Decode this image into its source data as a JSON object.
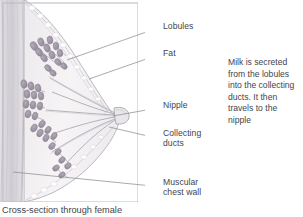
{
  "diagram": {
    "frame": {
      "x": 3,
      "y": 3,
      "width": 135,
      "height": 199
    },
    "labels": [
      {
        "id": "lobules",
        "text": "Lobules",
        "x": 163,
        "y": 26,
        "leader": {
          "x1": 152,
          "y1": 30,
          "x2": 67,
          "y2": 60
        }
      },
      {
        "id": "fat",
        "text": "Fat",
        "x": 163,
        "y": 53,
        "leader": {
          "x1": 152,
          "y1": 57,
          "x2": 89,
          "y2": 79
        }
      },
      {
        "id": "nipple",
        "text": "Nipple",
        "x": 163,
        "y": 105,
        "leader": {
          "x1": 152,
          "y1": 109,
          "x2": 113,
          "y2": 116
        }
      },
      {
        "id": "collecting-ducts",
        "text": "Collecting\nducts",
        "x": 163,
        "y": 133,
        "leader": {
          "x1": 152,
          "y1": 137,
          "x2": 109,
          "y2": 127
        }
      },
      {
        "id": "muscular-chest-wall",
        "text": "Muscular\nchest wall",
        "x": 163,
        "y": 182,
        "leader": {
          "x1": 152,
          "y1": 186,
          "x2": 13,
          "y2": 172
        }
      }
    ],
    "caption": {
      "id": "milk-secretion-note",
      "lines": [
        "Milk is secreted",
        "from the lobules",
        "into the collecting",
        "ducts. It then",
        "travels to the",
        "nipple"
      ]
    },
    "footer": {
      "text": "Cross-section through female"
    },
    "colors": {
      "frame_stroke": "#b9b9bd",
      "leader_stroke": "#8d8d93",
      "text": "#44444a",
      "skin": "#f3f1f2",
      "fat": "#eceaec",
      "lobule": "#a7a0ad",
      "duct": "#b5b2bb",
      "muscle": "#d8d5da",
      "background": "#ffffff"
    }
  }
}
